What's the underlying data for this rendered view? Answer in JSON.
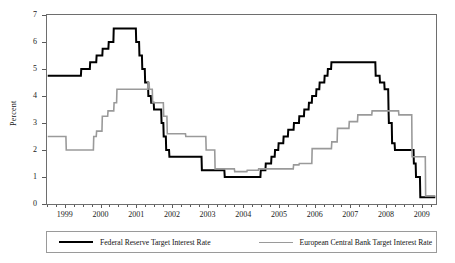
{
  "chart_data": {
    "type": "line",
    "title": "",
    "xlabel": "",
    "ylabel": "Percent",
    "ylim": [
      0,
      7
    ],
    "xlim": [
      1998.5,
      2009.4
    ],
    "ytick_labels": [
      "0",
      "1",
      "2",
      "3",
      "4",
      "5",
      "6",
      "7"
    ],
    "ytick_values": [
      0,
      1,
      2,
      3,
      4,
      5,
      6,
      7
    ],
    "xtick_labels": [
      "1999",
      "2000",
      "2001",
      "2002",
      "2003",
      "2004",
      "2005",
      "2006",
      "2007",
      "2008",
      "2009"
    ],
    "xtick_values": [
      1999,
      2000,
      2001,
      2002,
      2003,
      2004,
      2005,
      2006,
      2007,
      2008,
      2009
    ],
    "minor_ticks_per_year": 4,
    "grid": false,
    "legend_position": "bottom",
    "line_style": "step",
    "series": [
      {
        "name": "Federal Reserve Target Interest Rate",
        "color": "#000000",
        "width": 2.0,
        "points": [
          [
            1998.52,
            4.75
          ],
          [
            1999.45,
            4.75
          ],
          [
            1999.46,
            5.0
          ],
          [
            1999.7,
            5.0
          ],
          [
            1999.71,
            5.25
          ],
          [
            1999.88,
            5.25
          ],
          [
            1999.89,
            5.5
          ],
          [
            2000.05,
            5.5
          ],
          [
            2000.06,
            5.75
          ],
          [
            2000.22,
            5.75
          ],
          [
            2000.23,
            6.0
          ],
          [
            2000.36,
            6.0
          ],
          [
            2000.37,
            6.5
          ],
          [
            2000.99,
            6.5
          ],
          [
            2001.0,
            6.0
          ],
          [
            2001.08,
            6.0
          ],
          [
            2001.09,
            5.5
          ],
          [
            2001.16,
            5.5
          ],
          [
            2001.17,
            5.0
          ],
          [
            2001.24,
            5.0
          ],
          [
            2001.25,
            4.5
          ],
          [
            2001.33,
            4.5
          ],
          [
            2001.34,
            4.0
          ],
          [
            2001.41,
            4.0
          ],
          [
            2001.42,
            3.75
          ],
          [
            2001.49,
            3.75
          ],
          [
            2001.5,
            3.5
          ],
          [
            2001.7,
            3.5
          ],
          [
            2001.71,
            3.0
          ],
          [
            2001.76,
            3.0
          ],
          [
            2001.77,
            2.5
          ],
          [
            2001.83,
            2.5
          ],
          [
            2001.84,
            2.0
          ],
          [
            2001.92,
            2.0
          ],
          [
            2001.93,
            1.75
          ],
          [
            2002.83,
            1.75
          ],
          [
            2002.84,
            1.25
          ],
          [
            2003.47,
            1.25
          ],
          [
            2003.48,
            1.0
          ],
          [
            2004.48,
            1.0
          ],
          [
            2004.49,
            1.25
          ],
          [
            2004.62,
            1.25
          ],
          [
            2004.63,
            1.5
          ],
          [
            2004.78,
            1.5
          ],
          [
            2004.79,
            1.75
          ],
          [
            2004.88,
            1.75
          ],
          [
            2004.89,
            2.0
          ],
          [
            2004.98,
            2.0
          ],
          [
            2004.99,
            2.25
          ],
          [
            2005.12,
            2.25
          ],
          [
            2005.13,
            2.5
          ],
          [
            2005.25,
            2.5
          ],
          [
            2005.26,
            2.75
          ],
          [
            2005.41,
            2.75
          ],
          [
            2005.42,
            3.0
          ],
          [
            2005.56,
            3.0
          ],
          [
            2005.57,
            3.25
          ],
          [
            2005.7,
            3.25
          ],
          [
            2005.71,
            3.5
          ],
          [
            2005.83,
            3.5
          ],
          [
            2005.84,
            3.75
          ],
          [
            2005.92,
            3.75
          ],
          [
            2005.93,
            4.0
          ],
          [
            2006.04,
            4.0
          ],
          [
            2006.05,
            4.25
          ],
          [
            2006.13,
            4.25
          ],
          [
            2006.14,
            4.5
          ],
          [
            2006.27,
            4.5
          ],
          [
            2006.28,
            4.75
          ],
          [
            2006.36,
            4.75
          ],
          [
            2006.37,
            5.0
          ],
          [
            2006.46,
            5.0
          ],
          [
            2006.47,
            5.25
          ],
          [
            2007.7,
            5.25
          ],
          [
            2007.71,
            4.75
          ],
          [
            2007.82,
            4.75
          ],
          [
            2007.83,
            4.5
          ],
          [
            2007.95,
            4.5
          ],
          [
            2007.96,
            4.25
          ],
          [
            2008.06,
            4.25
          ],
          [
            2008.07,
            3.5
          ],
          [
            2008.08,
            3.0
          ],
          [
            2008.16,
            3.0
          ],
          [
            2008.17,
            2.25
          ],
          [
            2008.24,
            2.25
          ],
          [
            2008.25,
            2.0
          ],
          [
            2008.77,
            2.0
          ],
          [
            2008.78,
            1.5
          ],
          [
            2008.83,
            1.5
          ],
          [
            2008.84,
            1.0
          ],
          [
            2008.95,
            1.0
          ],
          [
            2008.96,
            0.25
          ],
          [
            2009.38,
            0.25
          ]
        ]
      },
      {
        "name": "European Central Bank Target Interest Rate",
        "color": "#9a9a9a",
        "width": 1.6,
        "points": [
          [
            1998.52,
            2.5
          ],
          [
            1999.03,
            2.5
          ],
          [
            1999.04,
            2.0
          ],
          [
            1999.8,
            2.0
          ],
          [
            1999.81,
            2.5
          ],
          [
            1999.88,
            2.5
          ],
          [
            1999.89,
            2.7
          ],
          [
            2000.04,
            2.7
          ],
          [
            2000.05,
            3.25
          ],
          [
            2000.2,
            3.25
          ],
          [
            2000.21,
            3.45
          ],
          [
            2000.37,
            3.45
          ],
          [
            2000.38,
            3.75
          ],
          [
            2000.45,
            3.75
          ],
          [
            2000.46,
            4.25
          ],
          [
            2000.75,
            4.25
          ],
          [
            2000.76,
            4.25
          ],
          [
            2001.32,
            4.25
          ],
          [
            2001.33,
            4.5
          ],
          [
            2001.36,
            4.5
          ],
          [
            2001.37,
            4.25
          ],
          [
            2001.45,
            4.25
          ],
          [
            2001.46,
            3.75
          ],
          [
            2001.76,
            3.75
          ],
          [
            2001.77,
            3.25
          ],
          [
            2001.86,
            3.25
          ],
          [
            2001.87,
            2.6
          ],
          [
            2002.38,
            2.6
          ],
          [
            2002.39,
            2.5
          ],
          [
            2002.95,
            2.5
          ],
          [
            2002.96,
            2.0
          ],
          [
            2003.2,
            2.0
          ],
          [
            2003.21,
            1.3
          ],
          [
            2003.75,
            1.3
          ],
          [
            2003.76,
            1.2
          ],
          [
            2004.1,
            1.2
          ],
          [
            2004.11,
            1.25
          ],
          [
            2004.42,
            1.25
          ],
          [
            2004.43,
            1.3
          ],
          [
            2005.4,
            1.3
          ],
          [
            2005.41,
            1.45
          ],
          [
            2005.56,
            1.45
          ],
          [
            2005.57,
            1.5
          ],
          [
            2005.92,
            1.5
          ],
          [
            2005.93,
            2.05
          ],
          [
            2006.47,
            2.05
          ],
          [
            2006.48,
            2.3
          ],
          [
            2006.63,
            2.3
          ],
          [
            2006.64,
            2.8
          ],
          [
            2006.96,
            2.8
          ],
          [
            2006.97,
            3.05
          ],
          [
            2007.2,
            3.05
          ],
          [
            2007.21,
            3.3
          ],
          [
            2007.6,
            3.3
          ],
          [
            2007.61,
            3.45
          ],
          [
            2008.35,
            3.45
          ],
          [
            2008.36,
            3.3
          ],
          [
            2008.72,
            3.3
          ],
          [
            2008.73,
            1.75
          ],
          [
            2009.1,
            1.75
          ],
          [
            2009.11,
            0.3
          ],
          [
            2009.38,
            0.3
          ]
        ]
      }
    ]
  },
  "legend": {
    "items": [
      {
        "label": "Federal Reserve Target Interest Rate",
        "color": "#000000",
        "width": "2.2px"
      },
      {
        "label": "European Central Bank Target Interest Rate",
        "color": "#9a9a9a",
        "width": "1.6px"
      }
    ]
  },
  "colors": {
    "fed_line": "#000000",
    "ecb_line": "#9a9a9a",
    "axis": "#6e6e6e",
    "text": "#1a1a1a",
    "background": "#ffffff"
  }
}
